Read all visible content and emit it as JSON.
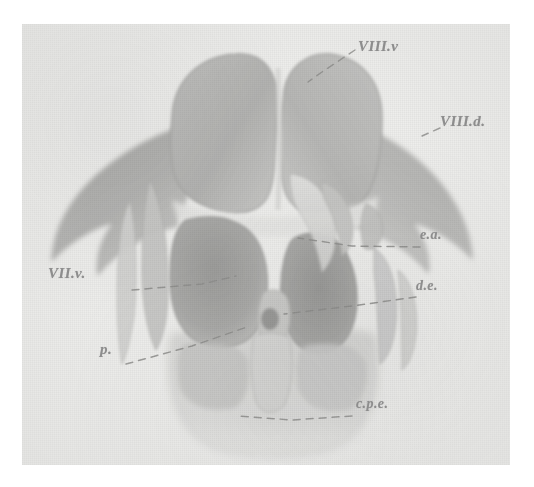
{
  "figure": {
    "kind": "scanned-anatomical-plate",
    "medium": "halftone photographic plate on textured paper",
    "orientation": "dorsal view, anterior at top",
    "background_color": "#eeeeec",
    "ink_color": "#8d8d8d",
    "paper_border_color": "#ffffff"
  },
  "labels": [
    {
      "id": "viii-v",
      "text": "VIII.v",
      "meaning": "nervus vestibulocochlearis, ventral ramus",
      "position": "upper right",
      "leader": "dashed, runs down-left to the right lobe of the paired dorsal mass"
    },
    {
      "id": "viii-d",
      "text": "VIII.d.",
      "meaning": "nervus vestibulocochlearis, dorsal ramus",
      "position": "right margin, upper",
      "leader": "short dash to the right ala"
    },
    {
      "id": "ea",
      "text": "e.a.",
      "meaning": "ductus endolymphaticus / eminentia anterior",
      "position": "right margin, middle",
      "leader": "long horizontal dashed line running left into the central mass"
    },
    {
      "id": "de",
      "text": "d.e.",
      "meaning": "ductus endolymphaticus",
      "position": "right margin, lower middle",
      "leader": "long dashed line running left to the midline tubercle"
    },
    {
      "id": "vii-v",
      "text": "VII.v.",
      "meaning": "nervus facialis, ventral ramus",
      "position": "left margin, middle",
      "leader": "dashed line running right into the left central lobe"
    },
    {
      "id": "p",
      "text": "p.",
      "meaning": "pars / papilla",
      "position": "left margin, lower",
      "leader": "dashed line running right and slightly up to the midline"
    },
    {
      "id": "cpe",
      "text": "c.p.e.",
      "meaning": "commissura posterior / canalis posterior externus",
      "position": "lower right",
      "leader": "long dashed line running left along the lower border"
    }
  ],
  "regions": [
    {
      "name": "dorsal-paired-lobes",
      "description": "large bilobed mass at top centre, mid-grey, split by a pale median sulcus"
    },
    {
      "name": "left-ala",
      "description": "broad dark wing sweeping down-left from the dorsal mass, concave lower edge, pointed tip"
    },
    {
      "name": "right-ala",
      "description": "mirror wing sweeping down-right, pointed tip, slightly lighter than the left"
    },
    {
      "name": "left-central-lobe",
      "description": "rounded dark grey lobe left of midline, below the dorsal mass"
    },
    {
      "name": "right-central-lobe",
      "description": "darker angular lobe right of midline with an overlying pale sickle"
    },
    {
      "name": "midline-tubercle",
      "description": "small dark oval node on the midline, just above the lower basin"
    },
    {
      "name": "inferior-basin",
      "description": "broad pale U-shaped plate at the bottom, faint outline, the c.p.e. region"
    }
  ]
}
